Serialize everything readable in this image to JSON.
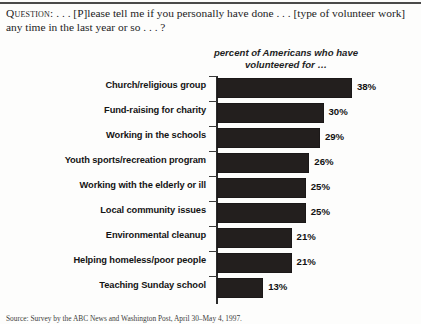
{
  "question": {
    "label": "Question:",
    "text": " . . . [P]lease tell me if you personally have done . . . [type of volunteer work] any time in the last year or so . . . ?"
  },
  "subtitle": "percent of Americans who have volunteered for …",
  "footnote": "Source: Survey by the ABC News and Washington Post, April 30–May 4, 1997.",
  "chart_data": {
    "type": "bar",
    "title": "percent of Americans who have volunteered for …",
    "orientation": "horizontal",
    "xlabel": "",
    "ylabel": "",
    "xlim": [
      0,
      40
    ],
    "grid": false,
    "legend": "none",
    "value_suffix": "%",
    "bar_color": "#231f1e",
    "categories": [
      "Church/religious group",
      "Fund-raising for charity",
      "Working in the schools",
      "Youth sports/recreation program",
      "Working with the elderly or ill",
      "Local community issues",
      "Environmental cleanup",
      "Helping homeless/poor people",
      "Teaching Sunday school"
    ],
    "values": [
      38,
      30,
      29,
      26,
      25,
      25,
      21,
      21,
      13
    ],
    "value_labels": [
      "38%",
      "30%",
      "29%",
      "26%",
      "25%",
      "25%",
      "21%",
      "21%",
      "13%"
    ]
  }
}
